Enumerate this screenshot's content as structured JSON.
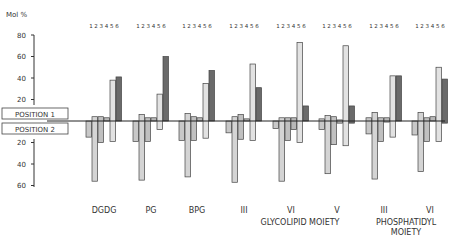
{
  "chart_data": {
    "type": "bar",
    "title": "",
    "ylabel": "Mol %",
    "xlabel": "",
    "ylim": [
      -60,
      80
    ],
    "yticks_up": [
      20,
      40,
      60,
      80
    ],
    "yticks_down": [
      20,
      40,
      60
    ],
    "baseline_labels": {
      "up": "POSITION 1",
      "down": "POSITION 2"
    },
    "bar_index_labels": "1 2 3 4 5 6",
    "categories": [
      "DGDG",
      "PG",
      "BPG",
      "III",
      "VI",
      "V",
      "III",
      "VI"
    ],
    "group_captions": [
      {
        "text": "GLYCOLIPID MOIETY",
        "spans": [
          "III",
          "VI",
          "V"
        ]
      },
      {
        "text": "PHOSPHATIDYL MOIETY",
        "spans": [
          "III",
          "VI"
        ]
      }
    ],
    "series_note": "Each bar 1-6 shows Position 1 (upward) and Position 2 (downward) mol %",
    "series": [
      {
        "name": "1",
        "position1": [
          0,
          0,
          0,
          0,
          0,
          2,
          3,
          0
        ],
        "position2": [
          15,
          19,
          18,
          11,
          7,
          8,
          12,
          13
        ]
      },
      {
        "name": "2",
        "position1": [
          4,
          6,
          7,
          4,
          3,
          5,
          8,
          8
        ],
        "position2": [
          56,
          55,
          52,
          57,
          56,
          49,
          54,
          47
        ]
      },
      {
        "name": "3",
        "position1": [
          4,
          3,
          4,
          6,
          3,
          4,
          3,
          3
        ],
        "position2": [
          20,
          19,
          18,
          17,
          18,
          22,
          19,
          19
        ]
      },
      {
        "name": "4",
        "position1": [
          3,
          3,
          3,
          2,
          3,
          1,
          3,
          4
        ],
        "position2": [
          0,
          0,
          0,
          0,
          8,
          2,
          1,
          0
        ]
      },
      {
        "name": "5",
        "position1": [
          38,
          25,
          35,
          53,
          73,
          70,
          42,
          50
        ],
        "position2": [
          19,
          8,
          16,
          18,
          20,
          23,
          15,
          19
        ]
      },
      {
        "name": "6",
        "position1": [
          41,
          60,
          47,
          31,
          14,
          14,
          42,
          39
        ],
        "position2": [
          0,
          0,
          0,
          0,
          0,
          2,
          0,
          2
        ]
      }
    ],
    "bar_fills": [
      "#c8c8c8",
      "#d4d4d4",
      "#c0c0c0",
      "#b8b8b8",
      "#e2e2e2",
      "#6a6a6a"
    ],
    "grid": false,
    "legend_position": "none"
  }
}
